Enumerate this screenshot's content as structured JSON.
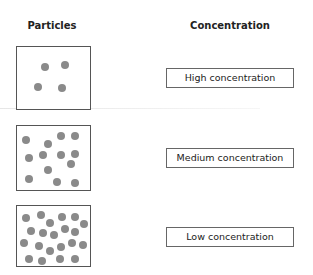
{
  "headers": {
    "particles": "Particles",
    "concentration": "Concentration"
  },
  "rows": [
    {
      "label": "Low concentration",
      "display_label": "High concentration",
      "box": {
        "top": 46,
        "height": 64
      },
      "label_top": 68,
      "dots": [
        [
          24,
          16
        ],
        [
          44,
          14
        ],
        [
          17,
          36
        ],
        [
          41,
          37
        ]
      ]
    },
    {
      "label": "Medium concentration",
      "box": {
        "top": 125,
        "height": 66
      },
      "label_top": 148,
      "dots": [
        [
          5,
          10
        ],
        [
          27,
          14
        ],
        [
          40,
          6
        ],
        [
          54,
          6
        ],
        [
          8,
          28
        ],
        [
          22,
          25
        ],
        [
          40,
          25
        ],
        [
          54,
          24
        ],
        [
          50,
          34
        ],
        [
          27,
          40
        ],
        [
          8,
          49
        ],
        [
          36,
          52
        ],
        [
          54,
          53
        ]
      ]
    },
    {
      "label": "High concentration",
      "display_label": "Low concentration",
      "box": {
        "top": 205,
        "height": 62
      },
      "label_top": 227,
      "dots": [
        [
          5,
          8
        ],
        [
          20,
          5
        ],
        [
          29,
          13
        ],
        [
          41,
          7
        ],
        [
          54,
          7
        ],
        [
          63,
          14
        ],
        [
          10,
          21
        ],
        [
          22,
          23
        ],
        [
          33,
          25
        ],
        [
          44,
          19
        ],
        [
          54,
          22
        ],
        [
          3,
          33
        ],
        [
          18,
          36
        ],
        [
          29,
          41
        ],
        [
          40,
          37
        ],
        [
          51,
          33
        ],
        [
          62,
          35
        ],
        [
          8,
          49
        ],
        [
          21,
          51
        ],
        [
          39,
          49
        ],
        [
          54,
          49
        ]
      ]
    }
  ],
  "colors": {
    "dot": "#8a8a8a",
    "border": "#555555"
  }
}
